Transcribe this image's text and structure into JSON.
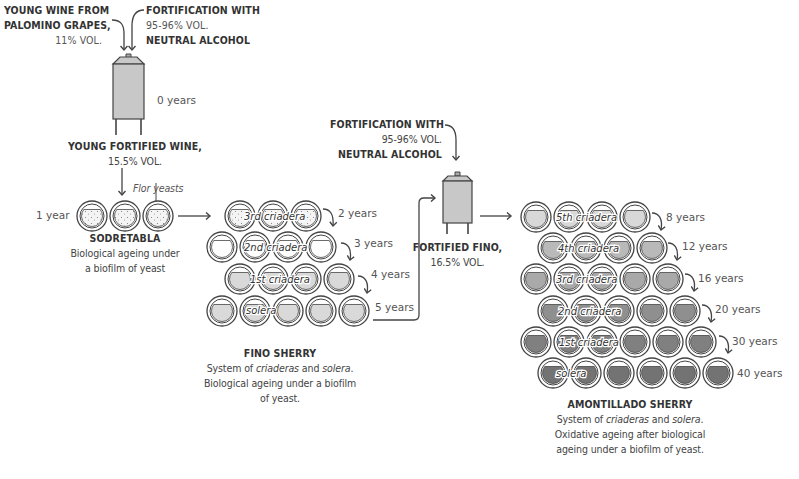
{
  "diagram": {
    "sources": {
      "wine": {
        "line1": "YOUNG WINE FROM",
        "line2": "PALOMINO GRAPES,",
        "line3": "11% VOL."
      },
      "fortification1": {
        "line1": "FORTIFICATION WITH",
        "line2": "95-96% VOL.",
        "line3": "NEUTRAL ALCOHOL"
      },
      "fortification2": {
        "line1": "FORTIFICATION WITH",
        "line2": "95-96% VOL.",
        "line3": "NEUTRAL ALCOHOL"
      }
    },
    "tank1": {
      "age": "0 years",
      "title": "YOUNG FORTIFIED WINE,",
      "vol": "15.5% VOL."
    },
    "tank2": {
      "title": "FORTIFIED FINO,",
      "vol": "16.5% VOL."
    },
    "flor_label": "Flor yeasts",
    "sodretabla": {
      "age": "1 year",
      "title": "SODRETABLA",
      "desc1": "Biological ageing under",
      "desc2": "a biofilm of yeast",
      "barrels": 3
    },
    "fino": {
      "title": "FINO SHERRY",
      "desc1_a": "System of ",
      "desc1_b": "criaderas",
      "desc1_c": " and ",
      "desc1_d": "solera",
      "desc1_e": ".",
      "desc2": "Biological ageing under a biofilm",
      "desc3": "of yeast.",
      "rows": [
        {
          "label": "3rd criadera",
          "age": "2 years",
          "count": 3
        },
        {
          "label": "2nd criadera",
          "age": "3 years",
          "count": 4
        },
        {
          "label": "1st criadera",
          "age": "4 years",
          "count": 4
        },
        {
          "label": "solera",
          "age": "5 years",
          "count": 5
        }
      ]
    },
    "amontillado": {
      "title": "AMONTILLADO SHERRY",
      "desc1_a": "System of ",
      "desc1_b": "criaderas",
      "desc1_c": " and ",
      "desc1_d": "solera",
      "desc1_e": ".",
      "desc2": "Oxidative ageing after biological",
      "desc3": "ageing under a biofilm of yeast.",
      "rows": [
        {
          "label": "5th criadera",
          "age": "8 years",
          "count": 4
        },
        {
          "label": "4th criadera",
          "age": "12 years",
          "count": 4
        },
        {
          "label": "3rd criadera",
          "age": "16 years",
          "count": 5
        },
        {
          "label": "2nd criadera",
          "age": "20 years",
          "count": 5
        },
        {
          "label": "1st criadera",
          "age": "30 years",
          "count": 6
        },
        {
          "label": "solera",
          "age": "40 years",
          "count": 6
        }
      ]
    },
    "colors": {
      "stroke": "#444444",
      "tank_fill": "#c8c8c8",
      "fino_fill": "#d9d9d9",
      "amontillado_shades": [
        "#d8d8d8",
        "#b9b9b9",
        "#a9a9a9",
        "#8f8f8f",
        "#808080",
        "#737373"
      ]
    }
  }
}
